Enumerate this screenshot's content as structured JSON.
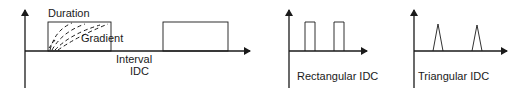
{
  "panels": {
    "interval": {
      "duration_label": "Duration",
      "gradient_label": "Gradient",
      "interval_label": "Interval",
      "idc_label": "IDC"
    },
    "rectangular": {
      "label": "Rectangular IDC"
    },
    "triangular": {
      "label": "Triangular IDC"
    }
  },
  "colors": {
    "stroke": "#1a1a1a",
    "background": "#ffffff"
  }
}
